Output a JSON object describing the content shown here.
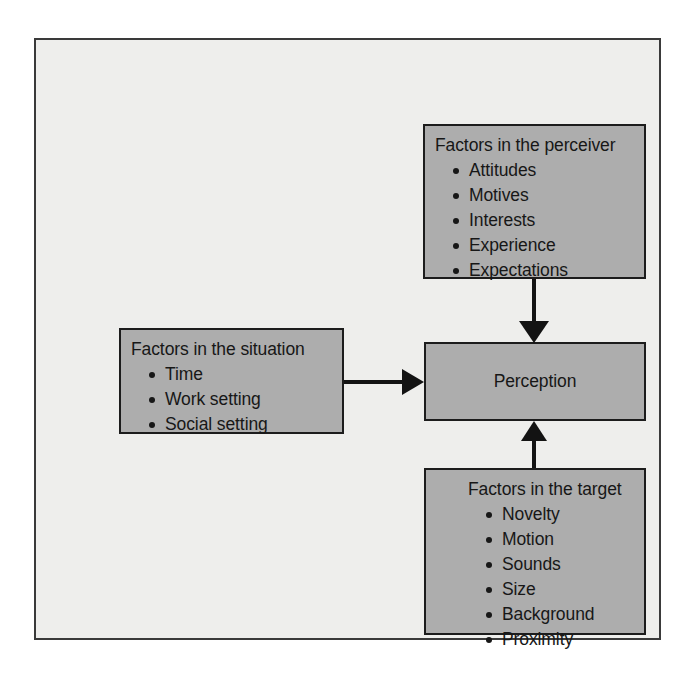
{
  "diagram": {
    "frame": {
      "background_color": "#eeeeec",
      "border_color": "#3a3a3a"
    },
    "box_style": {
      "fill_color": "#adadad",
      "border_color": "#1c1c1c",
      "text_color": "#171717"
    },
    "nodes": {
      "perceiver": {
        "title": "Factors in the perceiver",
        "items": [
          "Attitudes",
          "Motives",
          "Interests",
          "Experience",
          "Expectations"
        ]
      },
      "situation": {
        "title": "Factors in the situation",
        "items": [
          "Time",
          "Work setting",
          "Social setting"
        ]
      },
      "perception": {
        "label": "Perception"
      },
      "target": {
        "title": "Factors in the target",
        "items": [
          "Novelty",
          "Motion",
          "Sounds",
          "Size",
          "Background",
          "Proximity"
        ]
      }
    },
    "connectors": [
      {
        "from": "perceiver",
        "to": "perception",
        "direction": "down"
      },
      {
        "from": "situation",
        "to": "perception",
        "direction": "right"
      },
      {
        "from": "target",
        "to": "perception",
        "direction": "up"
      }
    ]
  }
}
